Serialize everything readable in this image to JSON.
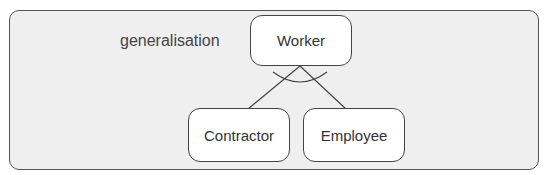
{
  "diagram": {
    "title_label": "generalisation",
    "nodes": {
      "parent": {
        "label": "Worker"
      },
      "child_left": {
        "label": "Contractor"
      },
      "child_right": {
        "label": "Employee"
      }
    },
    "relationship": "generalisation",
    "edges": [
      {
        "from": "Worker",
        "to": "Contractor"
      },
      {
        "from": "Worker",
        "to": "Employee"
      }
    ]
  }
}
